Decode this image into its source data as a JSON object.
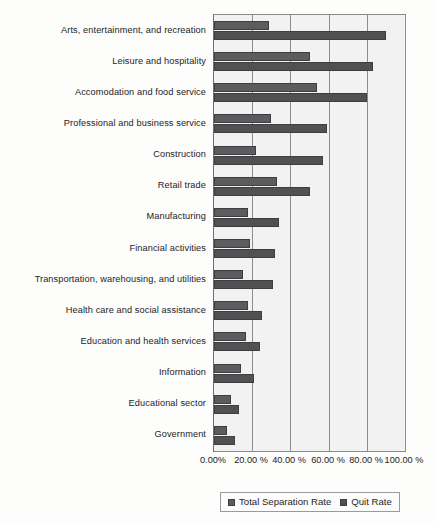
{
  "chart_data": {
    "type": "bar",
    "orientation": "horizontal",
    "title": "",
    "xlabel": "",
    "ylabel": "",
    "xlim": [
      0,
      100
    ],
    "grid": true,
    "legend_position": "bottom",
    "tick_labels": [
      "0.00%",
      "20.00 %",
      "40.00 %",
      "60.00 %",
      "80.00 %",
      "100.00 %"
    ],
    "tick_values": [
      0,
      20,
      40,
      60,
      80,
      100
    ],
    "categories": [
      "Arts, entertainment, and recreation",
      "Leisure and hospitality",
      "Accomodation and food service",
      "Professional and business service",
      "Construction",
      "Retail trade",
      "Manufacturing",
      "Financial activities",
      "Transportation, warehousing, and utilities",
      "Health care and social assistance",
      "Education and health services",
      "Information",
      "Educational sector",
      "Government"
    ],
    "series": [
      {
        "name": "Total Separation Rate",
        "color": "#5c5c5e",
        "values": [
          29,
          50,
          54,
          30,
          22,
          33,
          18,
          19,
          15,
          18,
          17,
          14,
          9,
          7
        ]
      },
      {
        "name": "Quit Rate",
        "color": "#515153",
        "values": [
          90,
          83,
          80,
          59,
          57,
          50,
          34,
          32,
          31,
          25,
          24,
          21,
          13,
          11
        ]
      }
    ]
  }
}
